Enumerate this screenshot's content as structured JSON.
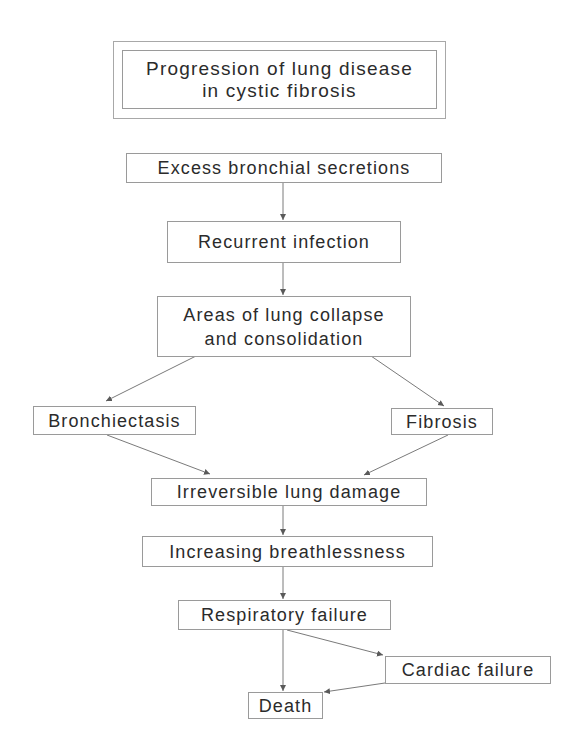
{
  "diagram": {
    "type": "flowchart",
    "title": {
      "line1": "Progression of lung disease",
      "line2": "in cystic fibrosis"
    },
    "nodes": {
      "excess_secretions": "Excess bronchial secretions",
      "recurrent_infection": "Recurrent infection",
      "lung_collapse": {
        "line1": "Areas of lung collapse",
        "line2": "and consolidation"
      },
      "bronchiectasis": "Bronchiectasis",
      "fibrosis": "Fibrosis",
      "irreversible_damage": "Irreversible lung damage",
      "breathlessness": "Increasing breathlessness",
      "respiratory_failure": "Respiratory failure",
      "cardiac_failure": "Cardiac failure",
      "death": "Death"
    },
    "edges": [
      {
        "from": "Excess bronchial secretions",
        "to": "Recurrent infection"
      },
      {
        "from": "Recurrent infection",
        "to": "Areas of lung collapse and consolidation"
      },
      {
        "from": "Areas of lung collapse and consolidation",
        "to": "Bronchiectasis"
      },
      {
        "from": "Areas of lung collapse and consolidation",
        "to": "Fibrosis"
      },
      {
        "from": "Bronchiectasis",
        "to": "Irreversible lung damage"
      },
      {
        "from": "Fibrosis",
        "to": "Irreversible lung damage"
      },
      {
        "from": "Irreversible lung damage",
        "to": "Increasing breathlessness"
      },
      {
        "from": "Increasing breathlessness",
        "to": "Respiratory failure"
      },
      {
        "from": "Respiratory failure",
        "to": "Death"
      },
      {
        "from": "Respiratory failure",
        "to": "Cardiac failure"
      },
      {
        "from": "Cardiac failure",
        "to": "Death"
      }
    ],
    "colors": {
      "line": "#7a7a7a",
      "border": "#9a9a9a",
      "text": "#2b2b2b",
      "background": "#ffffff"
    }
  }
}
